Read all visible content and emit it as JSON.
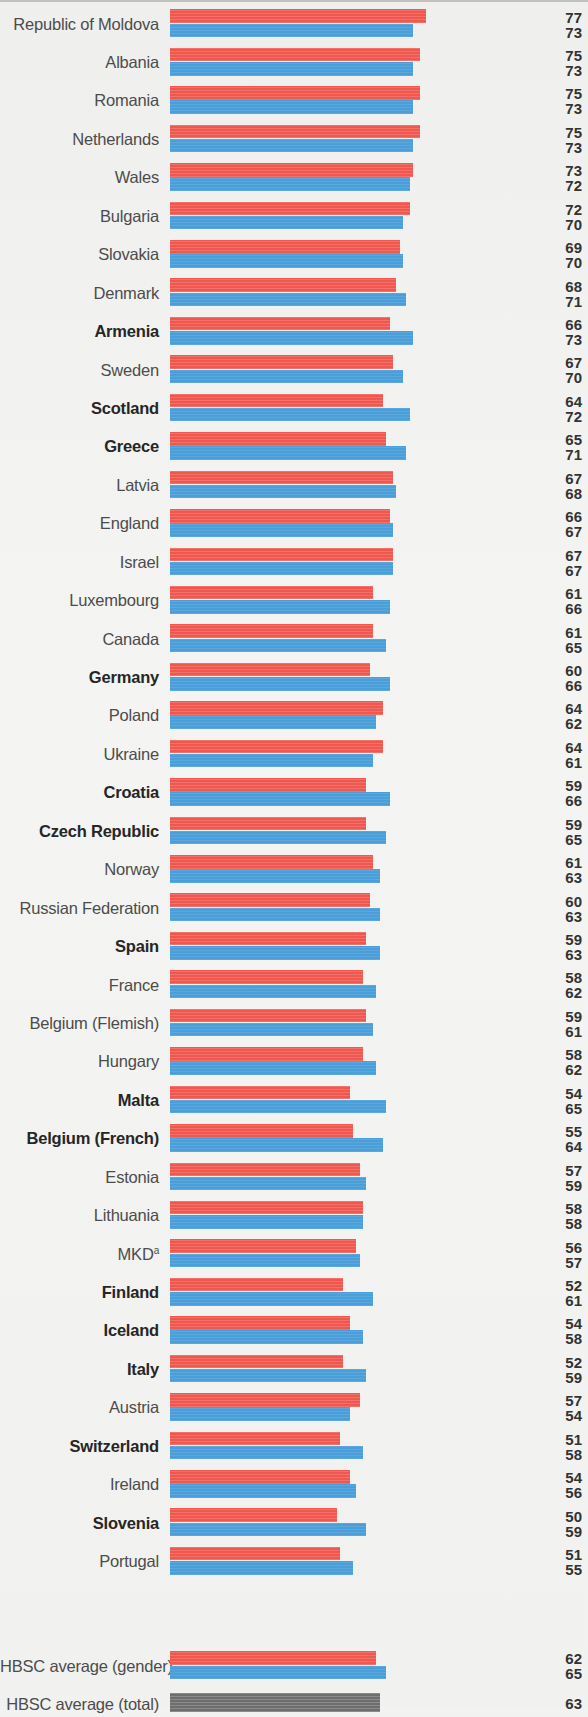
{
  "chart_data": {
    "type": "bar",
    "orientation": "horizontal",
    "title": "",
    "subtitle": "",
    "xlabel": "",
    "ylabel": "",
    "xlim": [
      0,
      80
    ],
    "grid": false,
    "legend_position": "none",
    "series": [
      {
        "name": "Boys",
        "color": "#f0574e"
      },
      {
        "name": "Girls",
        "color": "#4a9ed9"
      },
      {
        "name": "Total",
        "color": "#6e6e6e"
      }
    ],
    "categories": [
      "Republic of Moldova",
      "Albania",
      "Romania",
      "Netherlands",
      "Wales",
      "Bulgaria",
      "Slovakia",
      "Denmark",
      "Armenia",
      "Sweden",
      "Scotland",
      "Greece",
      "Latvia",
      "England",
      "Israel",
      "Luxembourg",
      "Canada",
      "Germany",
      "Poland",
      "Ukraine",
      "Croatia",
      "Czech Republic",
      "Norway",
      "Russian Federation",
      "Spain",
      "France",
      "Belgium (Flemish)",
      "Hungary",
      "Malta",
      "Belgium (French)",
      "Estonia",
      "Lithuania",
      "MKD",
      "Finland",
      "Iceland",
      "Italy",
      "Austria",
      "Switzerland",
      "Ireland",
      "Slovenia",
      "Portugal"
    ],
    "boys": [
      77,
      75,
      75,
      75,
      73,
      72,
      69,
      68,
      66,
      67,
      64,
      65,
      67,
      66,
      67,
      61,
      61,
      60,
      64,
      64,
      59,
      59,
      61,
      60,
      59,
      58,
      59,
      58,
      54,
      55,
      57,
      58,
      56,
      52,
      54,
      52,
      57,
      51,
      54,
      50,
      51
    ],
    "girls": [
      73,
      73,
      73,
      73,
      72,
      70,
      70,
      71,
      73,
      70,
      72,
      71,
      68,
      67,
      67,
      66,
      65,
      66,
      62,
      61,
      66,
      65,
      63,
      63,
      63,
      62,
      61,
      62,
      65,
      64,
      59,
      58,
      57,
      61,
      58,
      59,
      54,
      58,
      56,
      59,
      55
    ],
    "averages": [
      {
        "label": "HBSC average (gender)",
        "boys": 62,
        "girls": 65
      },
      {
        "label": "HBSC average (total)",
        "total": 63
      }
    ]
  },
  "rows": [
    {
      "label": "Republic of Moldova",
      "bold": false,
      "boys": 77,
      "girls": 73
    },
    {
      "label": "Albania",
      "bold": false,
      "boys": 75,
      "girls": 73
    },
    {
      "label": "Romania",
      "bold": false,
      "boys": 75,
      "girls": 73
    },
    {
      "label": "Netherlands",
      "bold": false,
      "boys": 75,
      "girls": 73
    },
    {
      "label": "Wales",
      "bold": false,
      "boys": 73,
      "girls": 72
    },
    {
      "label": "Bulgaria",
      "bold": false,
      "boys": 72,
      "girls": 70
    },
    {
      "label": "Slovakia",
      "bold": false,
      "boys": 69,
      "girls": 70
    },
    {
      "label": "Denmark",
      "bold": false,
      "boys": 68,
      "girls": 71
    },
    {
      "label": "Armenia",
      "bold": true,
      "boys": 66,
      "girls": 73
    },
    {
      "label": "Sweden",
      "bold": false,
      "boys": 67,
      "girls": 70
    },
    {
      "label": "Scotland",
      "bold": true,
      "boys": 64,
      "girls": 72
    },
    {
      "label": "Greece",
      "bold": true,
      "boys": 65,
      "girls": 71
    },
    {
      "label": "Latvia",
      "bold": false,
      "boys": 67,
      "girls": 68
    },
    {
      "label": "England",
      "bold": false,
      "boys": 66,
      "girls": 67
    },
    {
      "label": "Israel",
      "bold": false,
      "boys": 67,
      "girls": 67
    },
    {
      "label": "Luxembourg",
      "bold": false,
      "boys": 61,
      "girls": 66
    },
    {
      "label": "Canada",
      "bold": false,
      "boys": 61,
      "girls": 65
    },
    {
      "label": "Germany",
      "bold": true,
      "boys": 60,
      "girls": 66
    },
    {
      "label": "Poland",
      "bold": false,
      "boys": 64,
      "girls": 62
    },
    {
      "label": "Ukraine",
      "bold": false,
      "boys": 64,
      "girls": 61
    },
    {
      "label": "Croatia",
      "bold": true,
      "boys": 59,
      "girls": 66
    },
    {
      "label": "Czech Republic",
      "bold": true,
      "boys": 59,
      "girls": 65
    },
    {
      "label": "Norway",
      "bold": false,
      "boys": 61,
      "girls": 63
    },
    {
      "label": "Russian Federation",
      "bold": false,
      "boys": 60,
      "girls": 63
    },
    {
      "label": "Spain",
      "bold": true,
      "boys": 59,
      "girls": 63
    },
    {
      "label": "France",
      "bold": false,
      "boys": 58,
      "girls": 62
    },
    {
      "label": "Belgium (Flemish)",
      "bold": false,
      "boys": 59,
      "girls": 61
    },
    {
      "label": "Hungary",
      "bold": false,
      "boys": 58,
      "girls": 62
    },
    {
      "label": "Malta",
      "bold": true,
      "boys": 54,
      "girls": 65
    },
    {
      "label": "Belgium (French)",
      "bold": true,
      "boys": 55,
      "girls": 64
    },
    {
      "label": "Estonia",
      "bold": false,
      "boys": 57,
      "girls": 59
    },
    {
      "label": "Lithuania",
      "bold": false,
      "boys": 58,
      "girls": 58
    },
    {
      "label": "MKD",
      "bold": false,
      "superscript": "a",
      "boys": 56,
      "girls": 57
    },
    {
      "label": "Finland",
      "bold": true,
      "boys": 52,
      "girls": 61
    },
    {
      "label": "Iceland",
      "bold": true,
      "boys": 54,
      "girls": 58
    },
    {
      "label": "Italy",
      "bold": true,
      "boys": 52,
      "girls": 59
    },
    {
      "label": "Austria",
      "bold": false,
      "boys": 57,
      "girls": 54
    },
    {
      "label": "Switzerland",
      "bold": true,
      "boys": 51,
      "girls": 58
    },
    {
      "label": "Ireland",
      "bold": false,
      "boys": 54,
      "girls": 56
    },
    {
      "label": "Slovenia",
      "bold": true,
      "boys": 50,
      "girls": 59
    },
    {
      "label": "Portugal",
      "bold": false,
      "boys": 51,
      "girls": 55
    }
  ],
  "average_rows": [
    {
      "label": "HBSC average (gender)",
      "bold": false,
      "boys": 62,
      "girls": 65
    },
    {
      "label": "HBSC average (total)",
      "bold": false,
      "total": 63
    }
  ],
  "colors": {
    "boys": "#f0574e",
    "girls": "#4a9ed9",
    "total": "#6e6e6e",
    "background": "#f1f1ef",
    "label_text": "#4c4c4c",
    "value_text": "#333333"
  },
  "scale": {
    "bar_origin_px": 170,
    "px_per_unit": 3.33,
    "max_value": 77
  }
}
